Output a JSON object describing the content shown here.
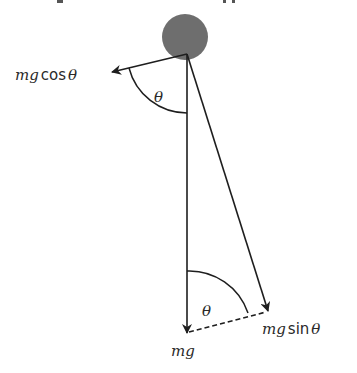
{
  "diagram": {
    "type": "force-decomposition",
    "colors": {
      "bob": "#6e6e6e",
      "line": "#1e1e1e",
      "text": "#2a2a2a"
    },
    "labels": {
      "cos_component": {
        "m": "m",
        "g": "g",
        "fn": "cos",
        "theta": "θ"
      },
      "sin_component": {
        "m": "m",
        "g": "g",
        "fn": "sin",
        "theta": "θ"
      },
      "weight": {
        "m": "m",
        "g": "g"
      },
      "angle_top": "θ",
      "angle_bottom": "θ"
    }
  }
}
